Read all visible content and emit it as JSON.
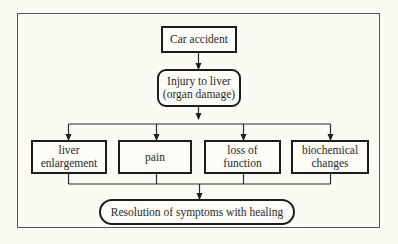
{
  "diagram": {
    "type": "flowchart",
    "nodes": {
      "cause": {
        "label": "Car accident",
        "shape": "rectangle"
      },
      "injury": {
        "label": "Injury to liver\n(organ damage)",
        "shape": "rounded-rectangle"
      },
      "effects": [
        {
          "label": "liver\nenlargement",
          "shape": "rectangle"
        },
        {
          "label": "pain",
          "shape": "rectangle"
        },
        {
          "label": "loss of\nfunction",
          "shape": "rectangle"
        },
        {
          "label": "biochemical\nchanges",
          "shape": "rectangle"
        }
      ],
      "outcome": {
        "label": "Resolution of symptoms with healing",
        "shape": "pill"
      }
    },
    "edges": [
      {
        "from": "Car accident",
        "to": "Injury to liver (organ damage)"
      },
      {
        "from": "Injury to liver (organ damage)",
        "to": "liver enlargement"
      },
      {
        "from": "Injury to liver (organ damage)",
        "to": "pain"
      },
      {
        "from": "Injury to liver (organ damage)",
        "to": "loss of function"
      },
      {
        "from": "Injury to liver (organ damage)",
        "to": "biochemical changes"
      },
      {
        "from": "liver enlargement",
        "to": "Resolution of symptoms with healing"
      },
      {
        "from": "pain",
        "to": "Resolution of symptoms with healing"
      },
      {
        "from": "loss of function",
        "to": "Resolution of symptoms with healing"
      },
      {
        "from": "biochemical changes",
        "to": "Resolution of symptoms with healing"
      }
    ]
  },
  "colors": {
    "background": "#fbfaf3",
    "stroke": "#1c1c1c",
    "frame": "#555555"
  }
}
